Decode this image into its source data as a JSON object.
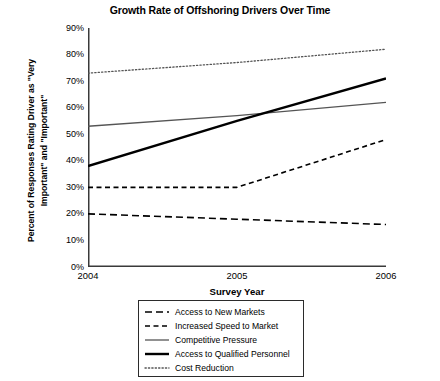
{
  "chart_data": {
    "type": "line",
    "title": "Growth Rate of Offshoring Drivers Over Time",
    "xlabel": "Survey Year",
    "ylabel_line1": "Percent of Responses Rating Driver as \"Very",
    "ylabel_line2": "Important\" and \"Important\"",
    "categories": [
      "2004",
      "2005",
      "2006"
    ],
    "x": [
      2004,
      2005,
      2006
    ],
    "xlim": [
      2004,
      2006
    ],
    "ylim": [
      0,
      90
    ],
    "ytick_labels": [
      "90%",
      "80%",
      "70%",
      "60%",
      "50%",
      "40%",
      "30%",
      "20%",
      "10%",
      "0%"
    ],
    "ytick_values": [
      90,
      80,
      70,
      60,
      50,
      40,
      30,
      20,
      10,
      0
    ],
    "grid": false,
    "legend_position": "below-center",
    "series": [
      {
        "name": "Access to New Markets",
        "values": [
          20,
          18,
          16
        ],
        "style": "dashed-long",
        "color": "#000000",
        "width": 1.6
      },
      {
        "name": "Increased Speed to Market",
        "values": [
          30,
          30,
          48
        ],
        "style": "dashed-short",
        "color": "#000000",
        "width": 1.6
      },
      {
        "name": "Competitive Pressure",
        "values": [
          53,
          57,
          62
        ],
        "style": "solid-thin",
        "color": "#555555",
        "width": 1.3
      },
      {
        "name": "Access to Qualified Personnel",
        "values": [
          38,
          55,
          71
        ],
        "style": "solid-thick",
        "color": "#000000",
        "width": 2.4
      },
      {
        "name": "Cost Reduction",
        "values": [
          73,
          77,
          82
        ],
        "style": "dotted",
        "color": "#555555",
        "width": 1.3
      }
    ]
  }
}
